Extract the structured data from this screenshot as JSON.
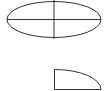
{
  "diagram": {
    "shapes": [
      {
        "name": "full-ellipse-with-axes",
        "cx": 54,
        "cy": 19.5,
        "rx": 47,
        "ry": 18
      },
      {
        "name": "quarter-ellipse",
        "x": 54,
        "y": 69,
        "width": 47,
        "height": 20
      }
    ],
    "stroke_color": "#333333"
  }
}
